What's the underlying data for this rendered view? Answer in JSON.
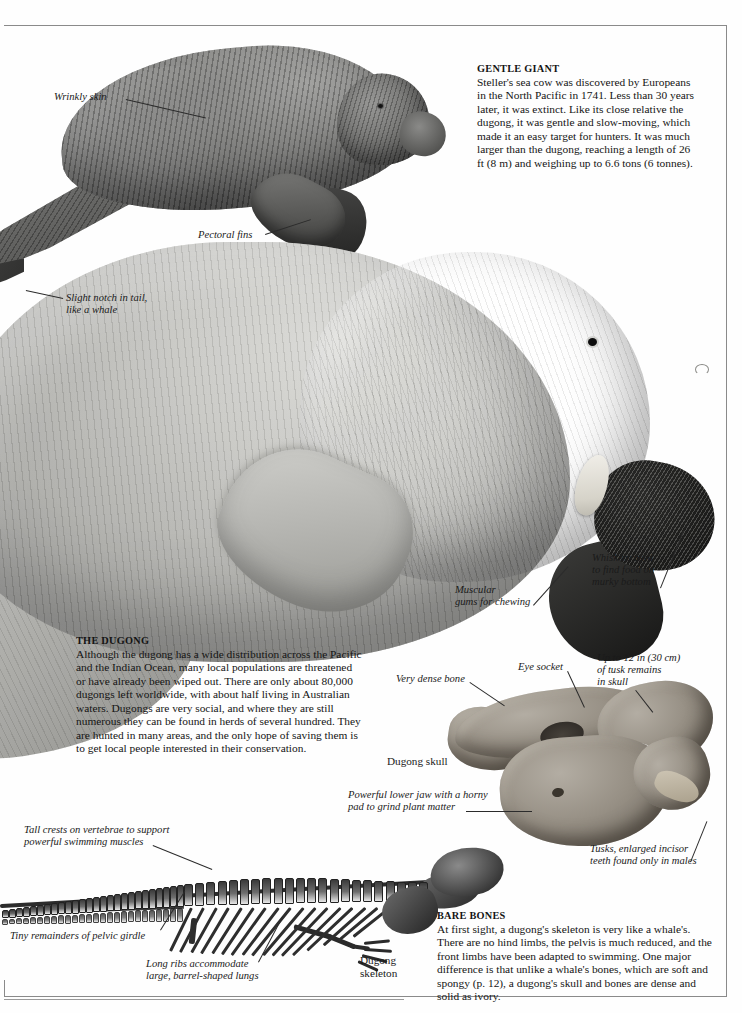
{
  "page": {
    "background_color": "#fefefe",
    "rule_color": "#8a8a8a"
  },
  "articles": [
    {
      "id": "gentle-giant",
      "heading": "GENTLE GIANT",
      "body": "Steller's sea cow was discovered by Europeans in the North Pacific in 1741. Less than 30 years later, it was extinct. Like its close relative the dugong, it was gentle and slow-moving, which made it an easy target for hunters. It was much larger than the dugong, reaching a length of 26 ft (8 m) and weighing up to 6.6 tons (6 tonnes)."
    },
    {
      "id": "the-dugong",
      "heading": "THE DUGONG",
      "body": "Although the dugong has a wide distribution across the Pacific and the Indian Ocean, many local populations are threatened or have already been wiped out. There are only about 80,000 dugongs left worldwide, with about half living in Australian waters. Dugongs are very social, and where they are still numerous they can be found in herds of several hundred. They are hunted in many areas, and the only hope of saving them is to get local people interested in their conservation."
    },
    {
      "id": "bare-bones",
      "heading": "BARE BONES",
      "body": "At first sight, a dugong's skeleton is very like a whale's. There are no hind limbs, the pelvis is much reduced, and the front limbs have been adapted to swimming. One major difference is that unlike a whale's bones, which are soft and spongy (p. 12), a dugong's skull and bones are dense and solid as ivory."
    }
  ],
  "annotations": {
    "wrinkly_skin": "Wrinkly skin",
    "pectoral_fins": "Pectoral fins",
    "slight_notch": "Slight notch in tail,\nlike a whale",
    "muscular_gums": "Muscular\ngums for chewing",
    "whiskers": "Whiskers used\nto find food on\nmurky bottom",
    "very_dense_bone": "Very dense bone",
    "eye_socket": "Eye socket",
    "tusk_remains": "Up to 12 in (30 cm)\nof tusk remains\nin skull",
    "dugong_skull": "Dugong skull",
    "powerful_jaw": "Powerful lower jaw with a horny\npad to grind plant matter",
    "tusks_incisor": "Tusks, enlarged incisor\nteeth found only in males",
    "tall_crests": "Tall crests on vertebrae to support\npowerful swimming muscles",
    "pelvic_girdle": "Tiny remainders of pelvic girdle",
    "long_ribs": "Long ribs accommodate\nlarge, barrel-shaped lungs",
    "dugong_skeleton": "Dugong\nskeleton"
  },
  "figures": {
    "stellers_sea_cow": "stellers-sea-cow-illustration",
    "dugong": "dugong-illustration",
    "skull": "dugong-skull-photograph",
    "skeleton": "dugong-skeleton-engraving"
  }
}
